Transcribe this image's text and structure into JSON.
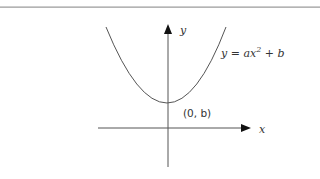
{
  "diagram": {
    "y_axis_label": "y",
    "x_axis_label": "x",
    "equation": {
      "lhs": "y = ax",
      "exponent": "2",
      "rhs": " + b"
    },
    "vertex_label": "(0, b)",
    "colors": {
      "line": "#555555",
      "text": "#333333",
      "rule": "#a8a8a8"
    }
  }
}
